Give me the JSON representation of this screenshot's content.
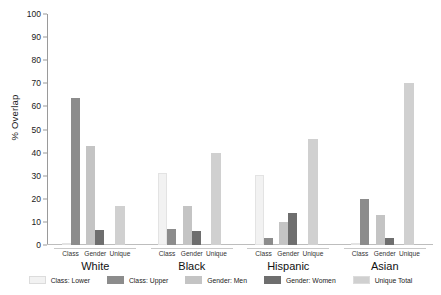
{
  "chart_data": {
    "type": "bar",
    "title": "",
    "xlabel": "",
    "ylabel": "% Overlap",
    "ylim": [
      0,
      100
    ],
    "ytick_step": 10,
    "yticks": [
      0,
      10,
      20,
      30,
      40,
      50,
      60,
      70,
      80,
      90,
      100
    ],
    "grid": false,
    "legend_position": "bottom",
    "groups": [
      "White",
      "Black",
      "Hispanic",
      "Asian"
    ],
    "positions": [
      "Class",
      "Gender",
      "Unique"
    ],
    "series": [
      {
        "name": "Class: Lower",
        "color": "#f2f2f2",
        "position": "Class",
        "values": [
          0,
          31,
          30.5,
          0
        ]
      },
      {
        "name": "Class: Upper",
        "color": "#8c8c8c",
        "position": "Class",
        "values": [
          63.5,
          7,
          3,
          20
        ]
      },
      {
        "name": "Gender: Men",
        "color": "#c4c4c4",
        "position": "Gender",
        "values": [
          43,
          17,
          10,
          13
        ]
      },
      {
        "name": "Gender: Women",
        "color": "#6e6e6e",
        "position": "Gender",
        "values": [
          6.5,
          6,
          14,
          3
        ]
      },
      {
        "name": "Unique Total",
        "color": "#d0d0d0",
        "position": "Unique",
        "values": [
          17,
          40,
          46,
          70
        ]
      }
    ]
  },
  "axis": {
    "y_title": "% Overlap"
  }
}
